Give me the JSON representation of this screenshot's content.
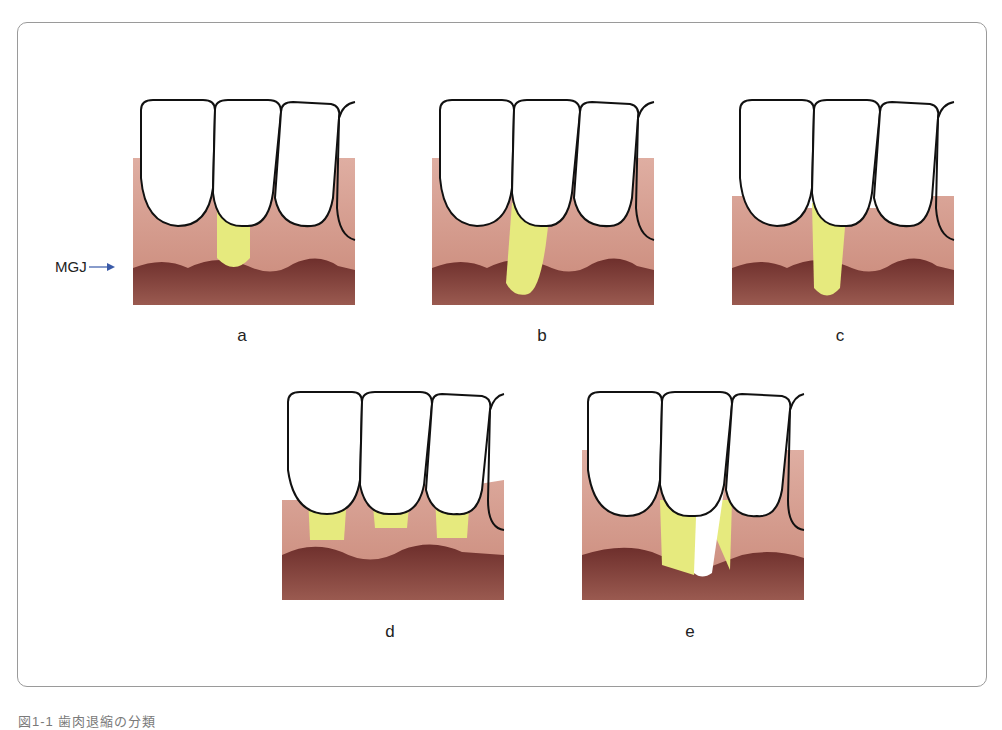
{
  "figure": {
    "caption": "図1-1 歯肉退縮の分類",
    "mgj_label": "MGJ",
    "colors": {
      "gingiva": "#d4988a",
      "alveolar_mucosa": "#7a3a34",
      "exposed_root": "#e8eb8a",
      "tooth": "#ffffff",
      "outline": "#111111",
      "arrow": "#3a5aa8"
    },
    "panels": [
      {
        "id": "a",
        "label": "a",
        "description": "Recession not reaching MGJ"
      },
      {
        "id": "b",
        "label": "b",
        "description": "Recession reaching/exceeding MGJ"
      },
      {
        "id": "c",
        "label": "c",
        "description": "Recession beyond MGJ with interdental loss"
      },
      {
        "id": "d",
        "label": "d",
        "description": "Multiple recessions"
      },
      {
        "id": "e",
        "label": "e",
        "description": "Recession with interdental tissue loss"
      }
    ]
  }
}
